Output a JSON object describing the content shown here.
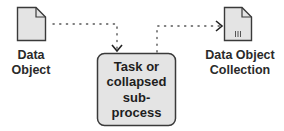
{
  "diagram": {
    "data_object": {
      "label_line1": "Data",
      "label_line2": "Object"
    },
    "data_object_collection": {
      "label": "Data Object Collection",
      "label_line1": "Data Object",
      "label_line2": "Collection",
      "marker": "III"
    },
    "task": {
      "line1": "Task or",
      "line2": "collapsed",
      "line3": "sub-",
      "line4": "process"
    },
    "colors": {
      "fill": "#e4e4e4",
      "stroke": "#3a3a3a",
      "text": "#222222",
      "connector": "#555555"
    }
  }
}
